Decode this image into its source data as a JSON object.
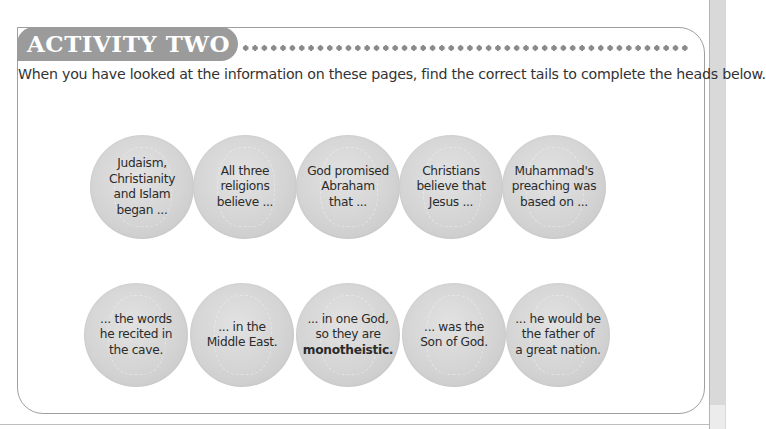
{
  "activity": {
    "title": "ACTIVITY TWO",
    "instructions": "When you have looked at the information on these pages, find the correct tails to complete the heads below."
  },
  "heads": [
    {
      "text": "Judaism,\nChristianity\nand Islam\nbegan ..."
    },
    {
      "text": "All three\nreligions\nbelieve ..."
    },
    {
      "text": "God promised\nAbraham\nthat ..."
    },
    {
      "text": "Christians\nbelieve that\nJesus ..."
    },
    {
      "text": "Muhammad's\npreaching was\nbased on ..."
    }
  ],
  "tails": [
    {
      "text": "... the words\nhe recited in\nthe cave."
    },
    {
      "text": "... in the\nMiddle East."
    },
    {
      "text": "... in one God,\nso they are\n",
      "bold": "monotheistic."
    },
    {
      "text": "... was the\nSon of God."
    },
    {
      "text": "... he would be\nthe father of\na great nation."
    }
  ],
  "colors": {
    "header_pill": "#9b9b9b",
    "coin": "#d4d4d4",
    "text": "#2b2b2b"
  }
}
